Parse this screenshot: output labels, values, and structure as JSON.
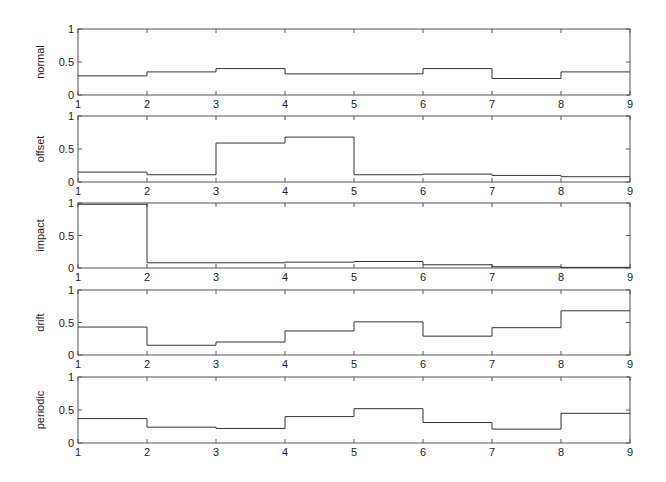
{
  "figure": {
    "layout": "5 stacked subplots, shared x range",
    "line_color": "#333333",
    "axis_color": "#555555",
    "background": "#ffffff"
  },
  "chart_data": [
    {
      "type": "line",
      "style": "stairs",
      "ylabel": "normal",
      "xlabel": "",
      "title": "",
      "x": [
        1,
        2,
        3,
        4,
        5,
        6,
        7,
        8,
        9
      ],
      "values": [
        0.29,
        0.35,
        0.4,
        0.32,
        0.32,
        0.4,
        0.25,
        0.35
      ],
      "xlim": [
        1,
        9
      ],
      "ylim": [
        0,
        1
      ],
      "xticks": [
        "1",
        "2",
        "3",
        "4",
        "5",
        "6",
        "7",
        "8",
        "9"
      ],
      "yticks": [
        "0",
        "0.5",
        "1"
      ],
      "grid": false,
      "legend": null
    },
    {
      "type": "line",
      "style": "stairs",
      "ylabel": "offset",
      "xlabel": "",
      "title": "",
      "x": [
        1,
        2,
        3,
        4,
        5,
        6,
        7,
        8,
        9
      ],
      "values": [
        0.15,
        0.11,
        0.59,
        0.68,
        0.11,
        0.12,
        0.1,
        0.08
      ],
      "xlim": [
        1,
        9
      ],
      "ylim": [
        0,
        1
      ],
      "xticks": [
        "1",
        "2",
        "3",
        "4",
        "5",
        "6",
        "7",
        "8",
        "9"
      ],
      "yticks": [
        "0",
        "0.5",
        "1"
      ],
      "grid": false,
      "legend": null
    },
    {
      "type": "line",
      "style": "stairs",
      "ylabel": "impact",
      "xlabel": "",
      "title": "",
      "x": [
        1,
        2,
        3,
        4,
        5,
        6,
        7,
        8,
        9
      ],
      "values": [
        0.98,
        0.08,
        0.08,
        0.09,
        0.1,
        0.05,
        0.02,
        0.01
      ],
      "xlim": [
        1,
        9
      ],
      "ylim": [
        0,
        1
      ],
      "xticks": [
        "1",
        "2",
        "3",
        "4",
        "5",
        "6",
        "7",
        "8",
        "9"
      ],
      "yticks": [
        "0",
        "0.5",
        "1"
      ],
      "grid": false,
      "legend": null
    },
    {
      "type": "line",
      "style": "stairs",
      "ylabel": "drift",
      "xlabel": "",
      "title": "",
      "x": [
        1,
        2,
        3,
        4,
        5,
        6,
        7,
        8,
        9
      ],
      "values": [
        0.43,
        0.15,
        0.2,
        0.37,
        0.51,
        0.29,
        0.42,
        0.68
      ],
      "xlim": [
        1,
        9
      ],
      "ylim": [
        0,
        1
      ],
      "xticks": [
        "1",
        "2",
        "3",
        "4",
        "5",
        "6",
        "7",
        "8",
        "9"
      ],
      "yticks": [
        "0",
        "0.5",
        "1"
      ],
      "grid": false,
      "legend": null
    },
    {
      "type": "line",
      "style": "stairs",
      "ylabel": "periodic",
      "xlabel": "",
      "title": "",
      "x": [
        1,
        2,
        3,
        4,
        5,
        6,
        7,
        8,
        9
      ],
      "values": [
        0.37,
        0.24,
        0.22,
        0.4,
        0.52,
        0.31,
        0.21,
        0.45
      ],
      "xlim": [
        1,
        9
      ],
      "ylim": [
        0,
        1
      ],
      "xticks": [
        "1",
        "2",
        "3",
        "4",
        "5",
        "6",
        "7",
        "8",
        "9"
      ],
      "yticks": [
        "0",
        "0.5",
        "1"
      ],
      "grid": false,
      "legend": null
    }
  ]
}
